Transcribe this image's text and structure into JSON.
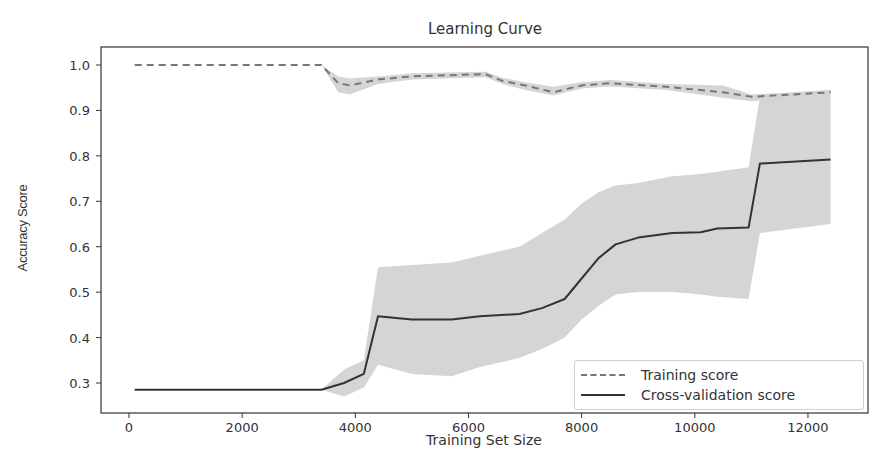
{
  "chart": {
    "title": "Learning Curve",
    "xlabel": "Training Set Size",
    "ylabel": "Accuracy Score",
    "x_ticks": [
      "0",
      "2000",
      "4000",
      "6000",
      "8000",
      "10000",
      "12000"
    ],
    "y_ticks": [
      "1.0",
      "0.9",
      "0.8",
      "0.7",
      "0.6",
      "0.5",
      "0.4",
      "0.3"
    ],
    "legend": {
      "training": "Training score",
      "cv": "Cross-validation score"
    }
  },
  "colors": {
    "band": "#d3d3d3",
    "training_line": "#777777",
    "cv_line": "#333333",
    "axis": "#333333"
  },
  "chart_data": {
    "type": "line",
    "title": "Learning Curve",
    "xlabel": "Training Set Size",
    "ylabel": "Accuracy Score",
    "xlim": [
      -500,
      13000
    ],
    "ylim": [
      0.23,
      1.04
    ],
    "grid": false,
    "legend_position": "lower right",
    "x_ticks": [
      0,
      2000,
      4000,
      6000,
      8000,
      10000,
      12000
    ],
    "y_ticks": [
      0.3,
      0.4,
      0.5,
      0.6,
      0.7,
      0.8,
      0.9,
      1.0
    ],
    "series": [
      {
        "name": "Training score",
        "style": "dashed",
        "x": [
          100,
          3400,
          3700,
          3900,
          4400,
          5000,
          6300,
          6600,
          7000,
          7500,
          8000,
          8500,
          9500,
          10500,
          11000,
          12400
        ],
        "values": [
          1.0,
          1.0,
          0.96,
          0.955,
          0.968,
          0.975,
          0.98,
          0.965,
          0.955,
          0.94,
          0.955,
          0.96,
          0.952,
          0.94,
          0.93,
          0.94
        ],
        "band_lower": [
          1.0,
          1.0,
          0.94,
          0.935,
          0.958,
          0.968,
          0.973,
          0.958,
          0.945,
          0.933,
          0.948,
          0.953,
          0.945,
          0.928,
          0.92,
          0.935
        ],
        "band_upper": [
          1.0,
          1.0,
          0.975,
          0.97,
          0.975,
          0.982,
          0.985,
          0.972,
          0.962,
          0.952,
          0.962,
          0.967,
          0.958,
          0.955,
          0.935,
          0.945
        ]
      },
      {
        "name": "Cross-validation score",
        "style": "solid",
        "x": [
          100,
          3400,
          3800,
          4150,
          4400,
          5000,
          5700,
          6200,
          6900,
          7300,
          7700,
          8000,
          8300,
          8600,
          9000,
          9600,
          10100,
          10400,
          10950,
          11150,
          12400
        ],
        "values": [
          0.285,
          0.285,
          0.3,
          0.32,
          0.447,
          0.44,
          0.44,
          0.447,
          0.452,
          0.465,
          0.485,
          0.53,
          0.575,
          0.605,
          0.62,
          0.63,
          0.632,
          0.64,
          0.642,
          0.783,
          0.792
        ],
        "band_lower": [
          0.285,
          0.285,
          0.27,
          0.29,
          0.34,
          0.32,
          0.315,
          0.335,
          0.355,
          0.375,
          0.4,
          0.44,
          0.47,
          0.495,
          0.5,
          0.5,
          0.495,
          0.49,
          0.485,
          0.63,
          0.65
        ],
        "band_upper": [
          0.285,
          0.285,
          0.33,
          0.35,
          0.555,
          0.56,
          0.565,
          0.58,
          0.6,
          0.63,
          0.66,
          0.695,
          0.72,
          0.735,
          0.74,
          0.755,
          0.76,
          0.765,
          0.775,
          0.93,
          0.945
        ]
      }
    ]
  }
}
